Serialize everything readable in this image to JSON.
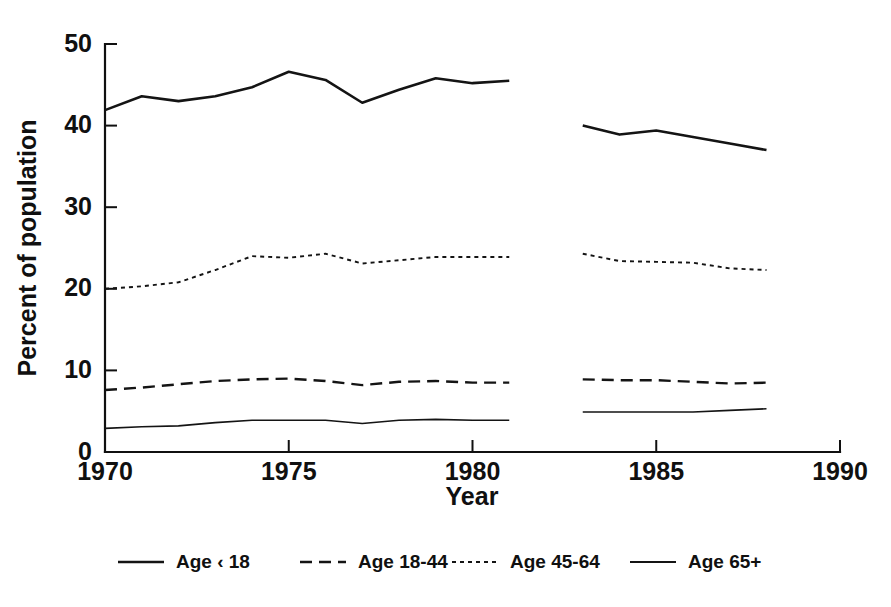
{
  "chart_data": {
    "type": "line",
    "title": "",
    "xlabel": "Year",
    "ylabel": "Percent of population",
    "xlim": [
      1970,
      1990
    ],
    "ylim": [
      0,
      50
    ],
    "xticks": [
      1970,
      1975,
      1980,
      1985,
      1990
    ],
    "yticks": [
      0,
      10,
      20,
      30,
      40,
      50
    ],
    "grid": false,
    "legend_position": "bottom",
    "note": "Each series is drawn as two separate segments with a break between 1981 and 1983 (no data plotted for 1982).",
    "series": [
      {
        "name": "Age < 18",
        "label": "Age ‹ 18",
        "style": "solid-thick",
        "x": [
          1970,
          1971,
          1972,
          1973,
          1974,
          1975,
          1976,
          1977,
          1978,
          1979,
          1980,
          1981,
          1983,
          1984,
          1985,
          1986,
          1987,
          1988
        ],
        "values": [
          41.9,
          43.6,
          43.0,
          43.6,
          44.7,
          46.6,
          45.6,
          42.8,
          44.4,
          45.8,
          45.2,
          45.5,
          40.0,
          38.9,
          39.4,
          38.6,
          37.8,
          37.0
        ]
      },
      {
        "name": "Age 45-64",
        "label": "Age 45-64",
        "style": "dotted",
        "x": [
          1970,
          1971,
          1972,
          1973,
          1974,
          1975,
          1976,
          1977,
          1978,
          1979,
          1980,
          1981,
          1983,
          1984,
          1985,
          1986,
          1987,
          1988
        ],
        "values": [
          20.0,
          20.3,
          20.8,
          22.3,
          24.0,
          23.8,
          24.3,
          23.1,
          23.5,
          23.9,
          23.9,
          23.9,
          24.3,
          23.4,
          23.3,
          23.2,
          22.5,
          22.3
        ]
      },
      {
        "name": "Age 18-44",
        "label": "Age 18-44",
        "style": "dashed",
        "x": [
          1970,
          1971,
          1972,
          1973,
          1974,
          1975,
          1976,
          1977,
          1978,
          1979,
          1980,
          1981,
          1983,
          1984,
          1985,
          1986,
          1987,
          1988
        ],
        "values": [
          7.6,
          7.9,
          8.3,
          8.7,
          8.9,
          9.0,
          8.7,
          8.2,
          8.6,
          8.7,
          8.5,
          8.5,
          8.9,
          8.8,
          8.8,
          8.6,
          8.4,
          8.5
        ]
      },
      {
        "name": "Age 65+",
        "label": "Age 65+",
        "style": "solid-thin",
        "x": [
          1970,
          1971,
          1972,
          1973,
          1974,
          1975,
          1976,
          1977,
          1978,
          1979,
          1980,
          1981,
          1983,
          1984,
          1985,
          1986,
          1987,
          1988
        ],
        "values": [
          2.9,
          3.1,
          3.2,
          3.6,
          3.9,
          3.9,
          3.9,
          3.5,
          3.9,
          4.0,
          3.9,
          3.9,
          4.9,
          4.9,
          4.9,
          4.9,
          5.1,
          5.3
        ]
      }
    ],
    "legend": [
      {
        "label": "Age ‹ 18",
        "style": "solid-thick"
      },
      {
        "label": "Age 18-44",
        "style": "dashed"
      },
      {
        "label": "Age 45-64",
        "style": "dotted"
      },
      {
        "label": "Age 65+",
        "style": "solid-thin"
      }
    ]
  }
}
